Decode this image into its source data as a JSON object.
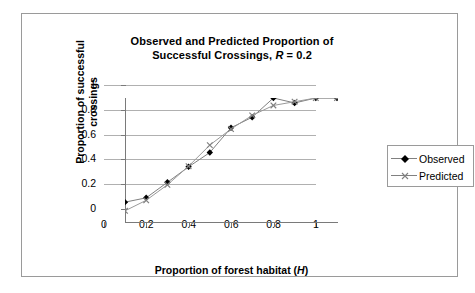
{
  "chart_data": {
    "type": "line",
    "title": "Observed and Predicted Proportion of Successful Crossings, R = 0.2",
    "title_line1": "Observed and Predicted Proportion of",
    "title_line2_prefix": "Successful Crossings, ",
    "title_line2_italic": "R",
    "title_line2_suffix": " = 0.2",
    "xlabel": "Proportion of forest habitat (H)",
    "xlabel_prefix": "Proportion of forest habitat (",
    "xlabel_italic": "H",
    "xlabel_suffix": ")",
    "ylabel": "Proportion of successful crossings",
    "ylabel_line1": "Proportion of successful",
    "ylabel_line2": "crossings",
    "x": [
      0,
      0.1,
      0.2,
      0.3,
      0.4,
      0.5,
      0.6,
      0.7,
      0.8,
      0.9,
      1
    ],
    "xlim": [
      0,
      1
    ],
    "ylim": [
      0,
      1
    ],
    "xticks": [
      "0",
      "0.2",
      "0.4",
      "0.6",
      "0.8",
      "1"
    ],
    "xtick_values": [
      0,
      0.2,
      0.4,
      0.6,
      0.8,
      1
    ],
    "yticks": [
      "0",
      "0.2",
      "0.4",
      "0.6",
      "0.8",
      "1"
    ],
    "ytick_values": [
      0,
      0.2,
      0.4,
      0.6,
      0.8,
      1
    ],
    "grid": "horizontal",
    "legend_position": "right",
    "series": [
      {
        "name": "Observed",
        "marker": "diamond",
        "color": "#000000",
        "line_color": "#808080",
        "values": [
          0.16,
          0.195,
          0.32,
          0.445,
          0.56,
          0.76,
          0.845,
          1.0,
          0.96,
          1.0,
          1.0
        ]
      },
      {
        "name": "Predicted",
        "marker": "cross",
        "color": "#808080",
        "line_color": "#9a9a9a",
        "values": [
          0.09,
          0.175,
          0.3,
          0.45,
          0.62,
          0.75,
          0.86,
          0.94,
          0.97,
          1.0,
          1.0
        ]
      }
    ]
  },
  "legend": {
    "entries": [
      {
        "label": "Observed"
      },
      {
        "label": "Predicted"
      }
    ]
  }
}
